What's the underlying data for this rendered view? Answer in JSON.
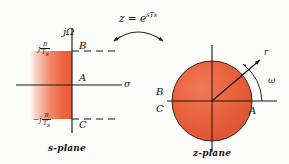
{
  "figure": {
    "mapping_formula": "z = e",
    "mapping_exponent": "sT",
    "mapping_exponent_sub": "s"
  },
  "s_plane": {
    "name": "s-plane",
    "vertical_axis_label": "jΩ",
    "horizontal_axis_label": "σ",
    "top_tick_label": {
      "prefix": "j",
      "numerator": "π",
      "denominator": "T",
      "denominator_sub": "s"
    },
    "bottom_tick_label": {
      "prefix": "−j",
      "numerator": "π",
      "denominator": "T",
      "denominator_sub": "s"
    },
    "points": [
      {
        "id": "B",
        "label": "B",
        "meaning": "upper strip boundary at j·pi/Ts"
      },
      {
        "id": "A",
        "label": "A",
        "meaning": "origin on real axis"
      },
      {
        "id": "C",
        "label": "C",
        "meaning": "lower strip boundary at -j·pi/Ts"
      }
    ],
    "shaded_region": "left-half primary strip",
    "shading_colors": {
      "solid": "#ef6243",
      "fade": "#ffffff"
    }
  },
  "z_plane": {
    "name": "z-plane",
    "unit_circle_fill": "#e8613f",
    "radius_vector_label": "r",
    "angle_label": "ω",
    "points": [
      {
        "id": "B",
        "label": "B",
        "meaning": "image of B above negative real axis"
      },
      {
        "id": "C",
        "label": "C",
        "meaning": "image of C below negative real axis"
      },
      {
        "id": "A",
        "label": "A",
        "meaning": "image of A at z = 1"
      }
    ]
  },
  "colors": {
    "background": "#fbfbf9",
    "ink": "#161616",
    "accent": "#ea5f3e"
  }
}
